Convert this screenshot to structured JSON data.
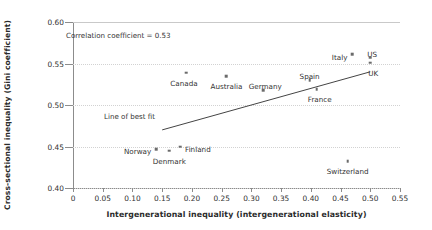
{
  "chart_data": {
    "type": "scatter",
    "title": "",
    "xlabel": "Intergenerational inequality (intergenerational elasticity)",
    "ylabel": "Cross-sectional inequality (Gini coefficient)",
    "xlim": [
      0,
      0.55
    ],
    "ylim": [
      0.4,
      0.6
    ],
    "xticks": [
      "0",
      "0.05",
      "0.10",
      "0.15",
      "0.20",
      "0.25",
      "0.30",
      "0.35",
      "0.40",
      "0.45",
      "0.50",
      "0.55"
    ],
    "xtick_values": [
      0,
      0.05,
      0.1,
      0.15,
      0.2,
      0.25,
      0.3,
      0.35,
      0.4,
      0.45,
      0.5,
      0.55
    ],
    "yticks": [
      "0.40",
      "0.45",
      "0.50",
      "0.55",
      "0.60"
    ],
    "ytick_values": [
      0.4,
      0.45,
      0.5,
      0.55,
      0.6
    ],
    "grid": true,
    "legend": "none",
    "points": [
      {
        "label": "Norway",
        "x": 0.14,
        "y": 0.447,
        "label_pos": "left"
      },
      {
        "label": "Denmark",
        "x": 0.162,
        "y": 0.445,
        "label_pos": "below"
      },
      {
        "label": "Finland",
        "x": 0.18,
        "y": 0.45,
        "label_pos": "right"
      },
      {
        "label": "Canada",
        "x": 0.19,
        "y": 0.539,
        "label_pos": "below-left"
      },
      {
        "label": "Australia",
        "x": 0.258,
        "y": 0.535,
        "label_pos": "below"
      },
      {
        "label": "Germany",
        "x": 0.32,
        "y": 0.518,
        "label_pos": "above-right"
      },
      {
        "label": "Spain",
        "x": 0.398,
        "y": 0.53,
        "label_pos": "above"
      },
      {
        "label": "France",
        "x": 0.41,
        "y": 0.519,
        "label_pos": "below-right"
      },
      {
        "label": "Switzerland",
        "x": 0.462,
        "y": 0.432,
        "label_pos": "below"
      },
      {
        "label": "Italy",
        "x": 0.47,
        "y": 0.561,
        "label_pos": "left"
      },
      {
        "label": "US",
        "x": 0.5,
        "y": 0.557,
        "label_pos": "above-right"
      },
      {
        "label": "UK",
        "x": 0.5,
        "y": 0.551,
        "label_pos": "below-right"
      }
    ],
    "fit_line": {
      "x0": 0.15,
      "y0": 0.47,
      "x1": 0.5,
      "y1": 0.54
    },
    "annotations": [
      {
        "name": "correlation",
        "text": "Correlation coefficient = 0.53"
      },
      {
        "name": "fit-line-label",
        "text": "Line of best fit"
      }
    ],
    "colors": {
      "marker": "#6b6b6b",
      "line": "#444444",
      "grid": "#d2d2d2",
      "axis": "#8c8c8c",
      "text": "#333333"
    }
  }
}
